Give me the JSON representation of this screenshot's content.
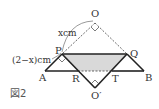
{
  "figure": {
    "caption": "図2",
    "labels": {
      "O": "O",
      "P": "P",
      "Q": "Q",
      "A": "A",
      "B": "B",
      "R": "R",
      "T": "T",
      "O_prime": "O′",
      "x_len": "xcm",
      "two_minus_x_len": "(2−x)cm"
    },
    "points": {
      "O": [
        95,
        23
      ],
      "P": [
        62,
        54
      ],
      "Q": [
        127,
        54
      ],
      "A": [
        45,
        71
      ],
      "B": [
        144,
        71
      ],
      "R": [
        78,
        71
      ],
      "T": [
        112,
        71
      ],
      "O_prime": [
        95,
        88
      ]
    },
    "colors": {
      "line": "#222222",
      "shade": "#d9d9d9",
      "dashed": "#444444"
    }
  }
}
